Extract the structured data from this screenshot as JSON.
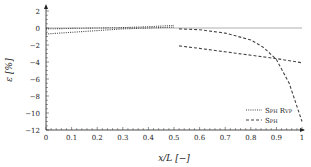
{
  "chart_data": {
    "type": "line",
    "title": "",
    "xlabel": "x/L [−]",
    "ylabel": "ε [%]",
    "xlim": [
      0,
      1
    ],
    "ylim": [
      -12,
      2.5
    ],
    "xticks": [
      "0",
      "0.1",
      "0.2",
      "0.3",
      "0.4",
      "0.5",
      "0.6",
      "0.7",
      "0.8",
      "0.9",
      "1"
    ],
    "yticks": [
      "2",
      "0",
      "−2",
      "−4",
      "−6",
      "−8",
      "−10",
      "−12"
    ],
    "grid": false,
    "legend_position": "lower right",
    "reference_line": {
      "y": 0,
      "x_range": [
        0,
        1
      ]
    },
    "series": [
      {
        "name": "SPH RVP",
        "style": "dotted",
        "segments": [
          {
            "x": [
              0,
              0.1,
              0.2,
              0.3,
              0.4,
              0.5
            ],
            "y": [
              -0.1,
              -0.05,
              0.0,
              0.05,
              0.15,
              0.3
            ]
          },
          {
            "x": [
              0,
              0.1,
              0.2,
              0.3,
              0.4,
              0.5
            ],
            "y": [
              -0.7,
              -0.5,
              -0.3,
              -0.1,
              0.0,
              0.1
            ]
          }
        ]
      },
      {
        "name": "SPH",
        "style": "dashed",
        "segments": [
          {
            "x": [
              0.52,
              0.6,
              0.7,
              0.8,
              0.85,
              0.9,
              0.95,
              1.0
            ],
            "y": [
              -0.1,
              -0.2,
              -0.6,
              -1.4,
              -2.3,
              -3.7,
              -6.5,
              -11.0
            ]
          },
          {
            "x": [
              0.52,
              0.6,
              0.7,
              0.8,
              0.9,
              1.0
            ],
            "y": [
              -2.1,
              -2.4,
              -2.8,
              -3.2,
              -3.6,
              -4.1
            ]
          }
        ]
      }
    ]
  },
  "legend": {
    "items": [
      {
        "label": "Sph Rvp",
        "style": "dotted"
      },
      {
        "label": "Sph",
        "style": "dashed"
      }
    ]
  },
  "axes": {
    "xlabel": "x/L [−]",
    "ylabel": "ε [%]"
  }
}
